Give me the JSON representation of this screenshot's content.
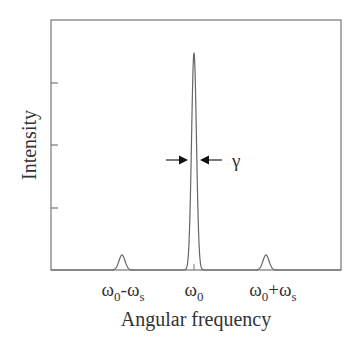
{
  "chart_data": {
    "type": "line",
    "title": "",
    "xlabel": "Angular frequency",
    "ylabel": "Intensity",
    "x_tick_labels": [
      {
        "base": "ω",
        "sub": "0",
        "op": "-",
        "base2": "ω",
        "sub2": "s",
        "x": -1
      },
      {
        "base": "ω",
        "sub": "0",
        "op": "",
        "base2": "",
        "sub2": "",
        "x": 0
      },
      {
        "base": "ω",
        "sub": "0",
        "op": "+",
        "base2": "ω",
        "sub2": "s",
        "x": 1
      }
    ],
    "x_tick_positions": [
      -1,
      0,
      1
    ],
    "xlim": [
      -2.0,
      2.0
    ],
    "ylim": [
      0,
      1.0
    ],
    "y_ticks": [
      0.25,
      0.5,
      0.75
    ],
    "y_tick_labels_shown": false,
    "grid": false,
    "legend": null,
    "series": [
      {
        "name": "spectrum",
        "description": "Central peak at ω0 with two small sidebands at ω0±ωs",
        "peaks": [
          {
            "x": -1,
            "height": 0.06,
            "width": 0.1
          },
          {
            "x": 0,
            "height": 0.87,
            "width": 0.08
          },
          {
            "x": 1,
            "height": 0.06,
            "width": 0.1
          }
        ]
      }
    ],
    "annotations": [
      {
        "type": "width-arrows",
        "x": 0,
        "y": 0.5,
        "label": "γ"
      }
    ]
  },
  "labels": {
    "xlabel": "Angular frequency",
    "ylabel": "Intensity",
    "gamma": "γ",
    "tick_left_main": "ω",
    "tick_left_sub": "0",
    "tick_left_op": "-",
    "tick_left_main2": "ω",
    "tick_left_sub2": "s",
    "tick_center_main": "ω",
    "tick_center_sub": "0",
    "tick_right_main": "ω",
    "tick_right_sub": "0",
    "tick_right_op": "+",
    "tick_right_main2": "ω",
    "tick_right_sub2": "s"
  }
}
